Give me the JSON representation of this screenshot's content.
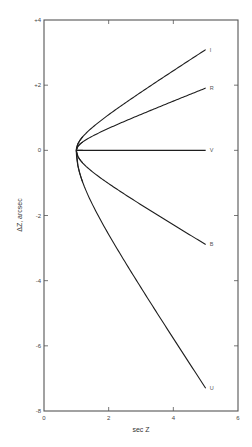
{
  "chart_data": {
    "type": "line",
    "title": "",
    "xlabel": "sec Z",
    "ylabel": "ΔZ, arcsec",
    "xlim": [
      0,
      6
    ],
    "ylim": [
      -8,
      4
    ],
    "xticks": [
      0,
      2,
      4,
      6
    ],
    "xtick_labels": [
      "0",
      "2",
      "4",
      "6"
    ],
    "yticks": [
      4,
      2,
      0,
      -2,
      -4,
      -6,
      -8
    ],
    "ytick_labels": [
      "+4",
      "+2",
      "0",
      "-2",
      "-4",
      "-6",
      "-8"
    ],
    "grid": false,
    "legend": "inline labels at right end of each curve",
    "x": [
      1.0,
      1.1,
      1.25,
      1.5,
      2.0,
      2.5,
      3.0,
      3.5,
      4.0,
      4.5,
      5.0
    ],
    "series": [
      {
        "name": "I",
        "values": [
          0,
          0.29,
          0.47,
          0.7,
          1.09,
          1.44,
          1.78,
          2.11,
          2.44,
          2.76,
          3.09
        ]
      },
      {
        "name": "R",
        "values": [
          0,
          0.18,
          0.29,
          0.44,
          0.68,
          0.89,
          1.1,
          1.31,
          1.51,
          1.71,
          1.91
        ]
      },
      {
        "name": "V",
        "values": [
          0,
          0,
          0,
          0,
          0,
          0,
          0,
          0,
          0,
          0,
          0
        ]
      },
      {
        "name": "B",
        "values": [
          0,
          -0.27,
          -0.44,
          -0.66,
          -1.02,
          -1.35,
          -1.67,
          -1.98,
          -2.29,
          -2.59,
          -2.89
        ]
      },
      {
        "name": "U",
        "values": [
          0,
          -0.68,
          -1.12,
          -1.67,
          -2.58,
          -3.41,
          -4.21,
          -5.0,
          -5.77,
          -6.54,
          -7.3
        ]
      }
    ]
  },
  "colors": {
    "axis": "#555555",
    "curve": "#1e1e1e",
    "background": "#ffffff"
  }
}
